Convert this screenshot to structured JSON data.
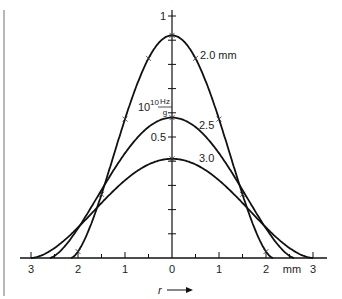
{
  "chart_data": {
    "type": "line",
    "title": "",
    "xlabel": "r",
    "xlabel_arrow": "→",
    "x_unit": "mm",
    "ylabel": "10^10 Hz/g",
    "ylabel_parts": {
      "base": "10",
      "exp": "10",
      "num": "Hz",
      "den": "g"
    },
    "xlim": [
      -3.1,
      3.1
    ],
    "ylim": [
      0,
      1.05
    ],
    "x_tick_labels": [
      "3",
      "2",
      "1",
      "0",
      "1",
      "2",
      "mm",
      "3"
    ],
    "x_ticks": [
      -3,
      -2.5,
      -2,
      -1.5,
      -1,
      -0.5,
      0,
      0.5,
      1,
      1.5,
      2,
      2.5,
      3
    ],
    "y_tick_labels": [
      {
        "value": 1,
        "label": "1"
      },
      {
        "value": 0.5,
        "label": "0.5"
      }
    ],
    "y_ticks": [
      0.1,
      0.2,
      0.3,
      0.4,
      0.5,
      0.6,
      0.7,
      0.8,
      0.9,
      1.0
    ],
    "grid": false,
    "legend": "inline labels",
    "series": [
      {
        "name": "2.0 mm",
        "label": "2.0 mm",
        "peak": 0.92,
        "half_width_zero": 2.15,
        "x": [
          -2.15,
          -2.0,
          -1.5,
          -1.0,
          -0.5,
          0,
          0.5,
          1.0,
          1.5,
          2.0,
          2.15
        ],
        "y": [
          0.0,
          0.05,
          0.33,
          0.62,
          0.86,
          0.92,
          0.86,
          0.62,
          0.33,
          0.05,
          0.0
        ],
        "markers_x": [
          -2.0,
          -1.5,
          -1.0,
          -0.5,
          0,
          0.5,
          1.0,
          1.5,
          2.0
        ]
      },
      {
        "name": "2.5",
        "label": "2.5",
        "peak": 0.58,
        "half_width_zero": 2.6,
        "x": [
          -2.6,
          -2.0,
          -1.5,
          -1.0,
          -0.5,
          0,
          0.5,
          1.0,
          1.5,
          2.0,
          2.6
        ],
        "y": [
          0.0,
          0.18,
          0.34,
          0.47,
          0.55,
          0.58,
          0.55,
          0.47,
          0.34,
          0.18,
          0.0
        ],
        "markers_x": [
          0
        ]
      },
      {
        "name": "3.0",
        "label": "3.0",
        "peak": 0.41,
        "half_width_zero": 3.0,
        "x": [
          -3.0,
          -2.5,
          -2.0,
          -1.5,
          -1.0,
          -0.5,
          0,
          0.5,
          1.0,
          1.5,
          2.0,
          2.5,
          3.0
        ],
        "y": [
          0.0,
          0.06,
          0.14,
          0.23,
          0.32,
          0.38,
          0.41,
          0.38,
          0.32,
          0.23,
          0.14,
          0.06,
          0.0
        ],
        "markers_x": [
          0
        ]
      }
    ]
  }
}
